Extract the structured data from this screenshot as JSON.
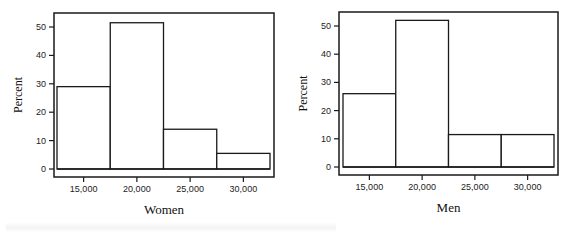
{
  "chart_data": [
    {
      "type": "bar",
      "title": "",
      "xlabel": "Women",
      "ylabel": "Percent",
      "categories": [
        "12,500–17,500",
        "17,500–22,500",
        "22,500–27,500",
        "27,500–32,500"
      ],
      "bin_edges": [
        12500,
        17500,
        22500,
        27500,
        32500
      ],
      "values": [
        29,
        51.5,
        14,
        5.5
      ],
      "xticks": [
        15000,
        20000,
        25000,
        30000
      ],
      "xtick_labels": [
        "15,000",
        "20,000",
        "25,000",
        "30,000"
      ],
      "yticks": [
        0,
        10,
        20,
        30,
        40,
        50
      ],
      "ylim": [
        0,
        55
      ],
      "grid": false,
      "histogram": true
    },
    {
      "type": "bar",
      "title": "",
      "xlabel": "Men",
      "ylabel": "Percent",
      "categories": [
        "12,500–17,500",
        "17,500–22,500",
        "22,500–27,500",
        "27,500–32,500"
      ],
      "bin_edges": [
        12500,
        17500,
        22500,
        27500,
        32500
      ],
      "values": [
        26,
        52,
        11.5,
        11.5
      ],
      "xticks": [
        15000,
        20000,
        25000,
        30000
      ],
      "xtick_labels": [
        "15,000",
        "20,000",
        "25,000",
        "30,000"
      ],
      "yticks": [
        0,
        10,
        20,
        30,
        40,
        50
      ],
      "ylim": [
        0,
        55
      ],
      "grid": false,
      "histogram": true
    }
  ],
  "layout": [
    {
      "frame": [
        54,
        13,
        274,
        177
      ],
      "plot_x": [
        57,
        270
      ],
      "baseline": 169,
      "y50": 27,
      "label_x": 22,
      "title_y": 214
    },
    {
      "frame": [
        339,
        12,
        558,
        175
      ],
      "plot_x": [
        343,
        554
      ],
      "baseline": 167,
      "y50": 26,
      "label_x": 307,
      "title_y": 212
    }
  ],
  "colors": {
    "stroke": "#1a1a1a",
    "fill": "#ffffff"
  }
}
